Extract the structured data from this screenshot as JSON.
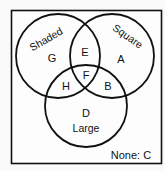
{
  "diagram": {
    "type": "venn",
    "colors": {
      "stroke": "#111111",
      "background": "#fafafa",
      "text": "#111111"
    },
    "sets": [
      {
        "id": "shaded",
        "label": "Shaded"
      },
      {
        "id": "square",
        "label": "Square"
      },
      {
        "id": "large",
        "label": "Large"
      }
    ],
    "regions": {
      "G": {
        "label": "G",
        "sets": [
          "shaded"
        ]
      },
      "A": {
        "label": "A",
        "sets": [
          "square"
        ]
      },
      "D": {
        "label": "D",
        "sets": [
          "large"
        ]
      },
      "E": {
        "label": "E",
        "sets": [
          "shaded",
          "square"
        ]
      },
      "H": {
        "label": "H",
        "sets": [
          "shaded",
          "large"
        ]
      },
      "B": {
        "label": "B",
        "sets": [
          "square",
          "large"
        ]
      },
      "F": {
        "label": "F",
        "sets": [
          "shaded",
          "square",
          "large"
        ]
      }
    },
    "none_label": "None: C"
  }
}
